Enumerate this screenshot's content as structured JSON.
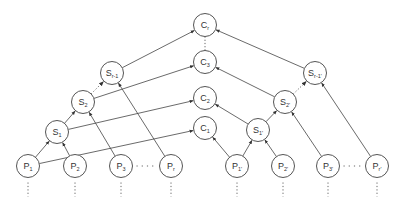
{
  "diagram": {
    "type": "merge-tree / hierarchical aggregation diagram",
    "colors": {
      "node_stroke": "#555555",
      "edge": "#444444",
      "background": "#ffffff"
    },
    "nodes": [
      {
        "id": "Cr",
        "base": "C",
        "sub": "r",
        "x": 205,
        "y": 25
      },
      {
        "id": "C3",
        "base": "C",
        "sub": "3",
        "x": 205,
        "y": 62
      },
      {
        "id": "C2",
        "base": "C",
        "sub": "2",
        "x": 205,
        "y": 98
      },
      {
        "id": "C1",
        "base": "C",
        "sub": "1",
        "x": 205,
        "y": 128
      },
      {
        "id": "S1",
        "base": "S",
        "sub": "1",
        "x": 57,
        "y": 132
      },
      {
        "id": "S2",
        "base": "S",
        "sub": "2",
        "x": 83,
        "y": 102
      },
      {
        "id": "Sr-1",
        "base": "S",
        "sub": "r-1",
        "x": 112,
        "y": 73
      },
      {
        "id": "S1p",
        "base": "S",
        "sub": "1'",
        "x": 258,
        "y": 130
      },
      {
        "id": "S2p",
        "base": "S",
        "sub": "2'",
        "x": 285,
        "y": 102
      },
      {
        "id": "Sr-1p",
        "base": "S",
        "sub": "r-1'",
        "x": 315,
        "y": 73
      },
      {
        "id": "P1",
        "base": "P",
        "sub": "1",
        "x": 28,
        "y": 166
      },
      {
        "id": "P2",
        "base": "P",
        "sub": "2",
        "x": 75,
        "y": 166
      },
      {
        "id": "P3",
        "base": "P",
        "sub": "3",
        "x": 121,
        "y": 166
      },
      {
        "id": "Pr",
        "base": "P",
        "sub": "r",
        "x": 171,
        "y": 166
      },
      {
        "id": "P1p",
        "base": "P",
        "sub": "1'",
        "x": 237,
        "y": 166
      },
      {
        "id": "P2p",
        "base": "P",
        "sub": "2'",
        "x": 283,
        "y": 166
      },
      {
        "id": "P3p",
        "base": "P",
        "sub": "3'",
        "x": 328,
        "y": 166
      },
      {
        "id": "Prp",
        "base": "P",
        "sub": "r'",
        "x": 377,
        "y": 166
      }
    ],
    "edges": [
      {
        "from": "P1",
        "to": "S1",
        "style": "solid"
      },
      {
        "from": "P2",
        "to": "S1",
        "style": "solid"
      },
      {
        "from": "S1",
        "to": "S2",
        "style": "solid"
      },
      {
        "from": "S2",
        "to": "Sr-1",
        "style": "dotted"
      },
      {
        "from": "P3",
        "to": "S2",
        "style": "solid"
      },
      {
        "from": "Pr",
        "to": "Sr-1",
        "style": "solid"
      },
      {
        "from": "P1",
        "to": "C1",
        "style": "solid"
      },
      {
        "from": "S1",
        "to": "C2",
        "style": "solid"
      },
      {
        "from": "S2",
        "to": "C3",
        "style": "solid"
      },
      {
        "from": "Sr-1",
        "to": "Cr",
        "style": "solid"
      },
      {
        "from": "P1p",
        "to": "S1p",
        "style": "solid"
      },
      {
        "from": "P2p",
        "to": "S1p",
        "style": "solid"
      },
      {
        "from": "S1p",
        "to": "S2p",
        "style": "solid"
      },
      {
        "from": "S2p",
        "to": "Sr-1p",
        "style": "dotted"
      },
      {
        "from": "P3p",
        "to": "S2p",
        "style": "solid"
      },
      {
        "from": "Prp",
        "to": "Sr-1p",
        "style": "solid"
      },
      {
        "from": "P1p",
        "to": "C1",
        "style": "solid"
      },
      {
        "from": "S1p",
        "to": "C2",
        "style": "solid"
      },
      {
        "from": "S2p",
        "to": "C3",
        "style": "solid"
      },
      {
        "from": "Sr-1p",
        "to": "Cr",
        "style": "solid"
      }
    ],
    "ellipses": [
      {
        "orientation": "vertical",
        "between": [
          "C3",
          "Cr"
        ]
      },
      {
        "orientation": "horizontal",
        "between": [
          "P3",
          "Pr"
        ]
      },
      {
        "orientation": "horizontal",
        "between": [
          "P3p",
          "Prp"
        ]
      },
      {
        "orientation": "vertical-below",
        "under": [
          "P1",
          "P2",
          "P3",
          "Pr",
          "P1p",
          "P2p",
          "P3p",
          "Prp"
        ]
      }
    ]
  }
}
